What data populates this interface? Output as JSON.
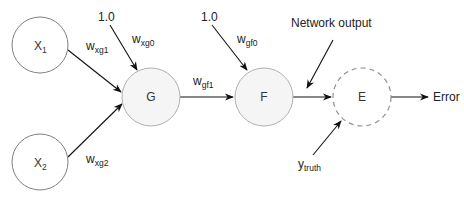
{
  "diagram": {
    "nodes": [
      {
        "id": "X1",
        "label": "X",
        "sub": "1",
        "style": "plain",
        "cx": 40,
        "cy": 45,
        "r": 28
      },
      {
        "id": "X2",
        "label": "X",
        "sub": "2",
        "style": "plain",
        "cx": 40,
        "cy": 162,
        "r": 28
      },
      {
        "id": "G",
        "label": "G",
        "style": "filled",
        "cx": 151,
        "cy": 97,
        "r": 29
      },
      {
        "id": "F",
        "label": "F",
        "style": "filled",
        "cx": 264,
        "cy": 97,
        "r": 29
      },
      {
        "id": "E",
        "label": "E",
        "style": "dashed",
        "cx": 362,
        "cy": 97,
        "r": 29
      }
    ],
    "edges": [
      {
        "from": "X1",
        "to": "G",
        "weight": "w",
        "weight_sub": "xg1"
      },
      {
        "from": "X2",
        "to": "G",
        "weight": "w",
        "weight_sub": "xg2"
      },
      {
        "from": "bias_g",
        "to": "G",
        "weight": "w",
        "weight_sub": "xg0"
      },
      {
        "from": "G",
        "to": "F",
        "weight": "w",
        "weight_sub": "gf1"
      },
      {
        "from": "bias_f",
        "to": "F",
        "weight": "w",
        "weight_sub": "gf0"
      },
      {
        "from": "F",
        "to": "E"
      },
      {
        "from": "network_output",
        "to": "E"
      },
      {
        "from": "y_truth",
        "to": "E"
      },
      {
        "from": "E",
        "to": "error"
      }
    ],
    "labels": {
      "bias_g": "1.0",
      "bias_f": "1.0",
      "network_output": "Network output",
      "y_truth_main": "y",
      "y_truth_sub": "truth",
      "error": "Error"
    },
    "colors": {
      "edge": "#111111",
      "node_plain_stroke": "#808080",
      "node_filled_fill": "#f5f5f5",
      "node_dashed_stroke": "#909090"
    }
  }
}
